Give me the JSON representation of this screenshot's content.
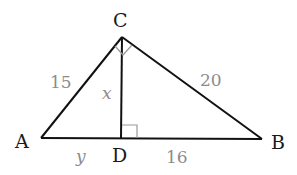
{
  "figure": {
    "type": "right-triangle-altitude",
    "vertices": {
      "A": "A",
      "B": "B",
      "C": "C",
      "D": "D"
    },
    "sides": {
      "AC": "15",
      "CB": "20",
      "DB": "16"
    },
    "variables": {
      "CD": "x",
      "AD": "y"
    },
    "right_angles": [
      "ACB",
      "CDB"
    ],
    "colors": {
      "line": "#111111",
      "measure_text": "#8c8c8c",
      "vertex_text": "#1a1a1a"
    }
  }
}
